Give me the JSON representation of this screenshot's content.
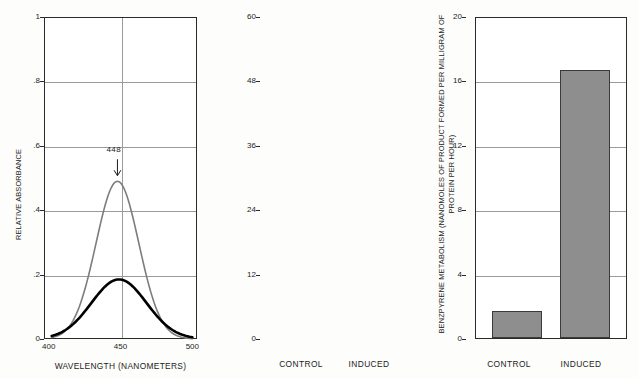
{
  "figure": {
    "panel_count": 3
  },
  "chart_data": [
    {
      "id": "absorbance-spectrum",
      "type": "line",
      "title": "",
      "xlabel": "WAVELENGTH (NANOMETERS)",
      "ylabel": "RELATIVE ABSORBANCE",
      "xlim": [
        400,
        500
      ],
      "ylim": [
        0,
        1
      ],
      "xticks": [
        "400",
        "450",
        "500"
      ],
      "yticks": [
        "1",
        ".8",
        ".6",
        ".4",
        ".2",
        "0"
      ],
      "grid": true,
      "legend": "none",
      "annotations": [
        {
          "text": "448",
          "x": 448,
          "y": 0.49,
          "arrow": "down"
        }
      ],
      "series": [
        {
          "name": "induced",
          "color": "#7d7d7d",
          "width": 1.6,
          "peak_x": 448,
          "peak_y": 0.49,
          "sigma": 14,
          "x": [
            412,
            420,
            428,
            434,
            440,
            444,
            448,
            452,
            456,
            462,
            468,
            476,
            486,
            494
          ],
          "y": [
            0.005,
            0.03,
            0.13,
            0.26,
            0.41,
            0.47,
            0.49,
            0.47,
            0.42,
            0.3,
            0.18,
            0.07,
            0.015,
            0.004
          ]
        },
        {
          "name": "control",
          "color": "#000000",
          "width": 2.6,
          "peak_x": 449,
          "peak_y": 0.185,
          "sigma": 18,
          "x": [
            412,
            420,
            428,
            434,
            440,
            444,
            449,
            454,
            460,
            466,
            472,
            480,
            488,
            494
          ],
          "y": [
            0.002,
            0.012,
            0.045,
            0.085,
            0.14,
            0.168,
            0.185,
            0.175,
            0.145,
            0.105,
            0.068,
            0.03,
            0.009,
            0.003
          ]
        }
      ]
    },
    {
      "id": "benzpyrene-nanomoles",
      "type": "bar",
      "title": "",
      "xlabel": "",
      "ylabel": "BENZPYRENE METABOLISM (NANOMOLES OF PRODUCT FORMED PER MILLIGRAM OF PROTEIN PER HOUR)",
      "ylim": [
        0,
        60
      ],
      "yticks": [
        "60",
        "48",
        "36",
        "24",
        "12",
        "0"
      ],
      "ytick_values": [
        60,
        48,
        36,
        24,
        12,
        0
      ],
      "grid": true,
      "categories": [
        "CONTROL",
        "INDUCED"
      ],
      "values": [
        5,
        50
      ],
      "bar_color": "#8e8e8e",
      "bar_edge_color": "#3a3a3a"
    },
    {
      "id": "benzpyrene-picomoles",
      "type": "bar",
      "title": "",
      "xlabel": "",
      "ylabel": "BENZPYRENE METABOLISM (PICOMOLES OF PRODUCT FORMED PER MILLIGRAM OF PROTEIN PER HOUR)",
      "ylim": [
        0,
        20
      ],
      "yticks": [
        "20",
        "16",
        "12",
        "8",
        "4",
        "0"
      ],
      "ytick_values": [
        20,
        16,
        12,
        8,
        4,
        0
      ],
      "grid": true,
      "categories": [
        "CONTROL",
        "INDUCED"
      ],
      "values": [
        2.8,
        17.0
      ],
      "bar_color": "#8e8e8e",
      "bar_edge_color": "#3a3a3a"
    }
  ]
}
